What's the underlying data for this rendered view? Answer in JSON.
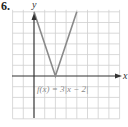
{
  "problem": {
    "number": "6."
  },
  "chart_data": {
    "type": "line",
    "title": "",
    "equation_label": "f(x) = 3|x − 2|",
    "xlabel": "x",
    "ylabel": "y",
    "xlim": [
      -2,
      8
    ],
    "ylim": [
      -4,
      6
    ],
    "grid": true,
    "series": [
      {
        "name": "f(x) = 3|x - 2|",
        "x": [
          0,
          2,
          4
        ],
        "y": [
          6,
          0,
          6
        ]
      }
    ]
  },
  "colors": {
    "curve": "#8a8a8a",
    "axis": "#333333",
    "grid": "#cfcfcf",
    "label": "#8a8a8a"
  }
}
